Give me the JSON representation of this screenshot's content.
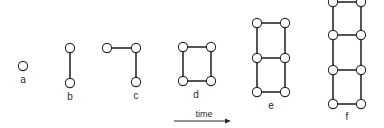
{
  "diagram": {
    "colors": {
      "line": "#2a2a2a",
      "node_fill": "#ffffff",
      "background": "#ffffff"
    },
    "stages": [
      {
        "label": "a",
        "label_pos": [
          23,
          83
        ],
        "nodes": [
          [
            23,
            66
          ]
        ],
        "edges": []
      },
      {
        "label": "b",
        "label_pos": [
          70,
          100
        ],
        "nodes": [
          [
            70,
            48
          ],
          [
            70,
            83
          ]
        ],
        "edges": [
          [
            0,
            1
          ]
        ]
      },
      {
        "label": "c",
        "label_pos": [
          136,
          99
        ],
        "nodes": [
          [
            107,
            48
          ],
          [
            136,
            48
          ],
          [
            136,
            82
          ]
        ],
        "edges": [
          [
            0,
            1
          ],
          [
            1,
            2
          ]
        ]
      },
      {
        "label": "d",
        "label_pos": [
          196,
          98
        ],
        "nodes": [
          [
            183,
            47
          ],
          [
            211,
            47
          ],
          [
            183,
            81
          ],
          [
            211,
            81
          ]
        ],
        "edges": [
          [
            0,
            1
          ],
          [
            0,
            2
          ],
          [
            1,
            3
          ],
          [
            2,
            3
          ]
        ]
      },
      {
        "label": "e",
        "label_pos": [
          271,
          109
        ],
        "nodes": [
          [
            257,
            23
          ],
          [
            285,
            23
          ],
          [
            257,
            58
          ],
          [
            285,
            58
          ],
          [
            257,
            92
          ],
          [
            285,
            92
          ]
        ],
        "edges": [
          [
            0,
            1
          ],
          [
            0,
            2
          ],
          [
            1,
            3
          ],
          [
            2,
            3
          ],
          [
            2,
            4
          ],
          [
            3,
            5
          ],
          [
            4,
            5
          ]
        ]
      },
      {
        "label": "f",
        "label_pos": [
          347,
          120
        ],
        "nodes": [
          [
            333,
            2
          ],
          [
            361,
            2
          ],
          [
            333,
            35
          ],
          [
            361,
            35
          ],
          [
            333,
            70
          ],
          [
            361,
            70
          ],
          [
            333,
            104
          ],
          [
            361,
            104
          ]
        ],
        "edges": [
          [
            0,
            1
          ],
          [
            0,
            2
          ],
          [
            1,
            3
          ],
          [
            2,
            3
          ],
          [
            2,
            4
          ],
          [
            3,
            5
          ],
          [
            4,
            5
          ],
          [
            4,
            6
          ],
          [
            5,
            7
          ],
          [
            6,
            7
          ]
        ]
      }
    ],
    "time_axis": {
      "label": "time",
      "label_pos": [
        204,
        117
      ],
      "arrow_from": [
        174,
        121
      ],
      "arrow_to": [
        231,
        121
      ]
    }
  }
}
